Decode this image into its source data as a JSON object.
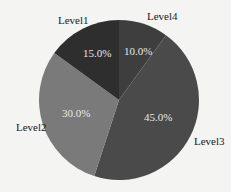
{
  "chart_data": {
    "type": "pie",
    "title": "",
    "categories": [
      "Level4",
      "Level3",
      "Level2",
      "Level1"
    ],
    "values": [
      10.0,
      45.0,
      30.0,
      15.0
    ],
    "value_labels": [
      "10.0%",
      "45.0%",
      "30.0%",
      "15.0%"
    ],
    "colors": [
      "#3e3e3e",
      "#4a4a4a",
      "#7a7a7a",
      "#2e2e2e"
    ],
    "start_angle": "12 o'clock",
    "direction": "clockwise",
    "legend": "none (labels outside slices)"
  },
  "labels": {
    "level1": "Level1",
    "level2": "Level2",
    "level3": "Level3",
    "level4": "Level4",
    "pct1": "15.0%",
    "pct2": "30.0%",
    "pct3": "45.0%",
    "pct4": "10.0%"
  }
}
